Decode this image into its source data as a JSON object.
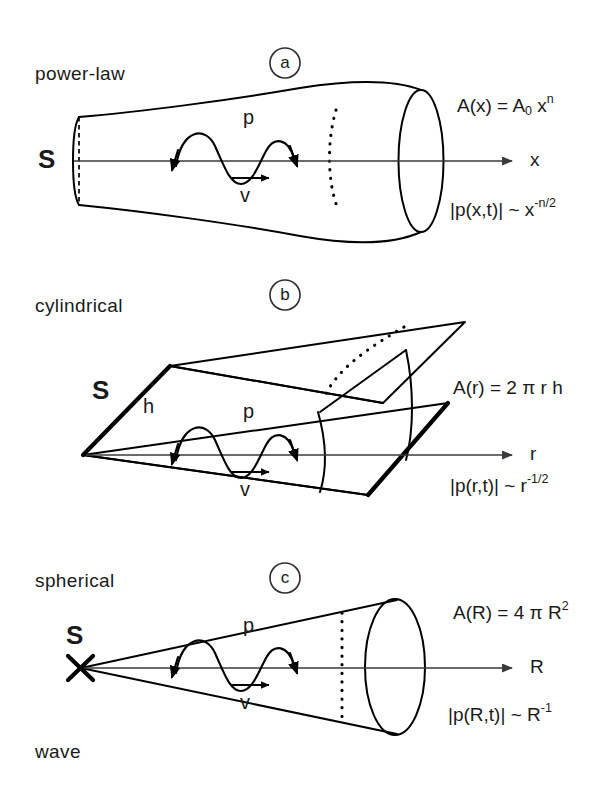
{
  "figure": {
    "background_color": "#ffffff",
    "ink_color": "#000000",
    "axis_color": "#3a3a3a"
  },
  "panels": [
    {
      "id": "a",
      "letter": "a",
      "category_label": "power-law",
      "source_label": "S",
      "axis_label": "x",
      "pressure_label": "p",
      "velocity_label": "v",
      "area_formula": {
        "lhs": "A(x) = A",
        "lhs_sub": "0",
        "mid": " x",
        "sup": "n"
      },
      "amplitude_formula": {
        "lhs": "|p(x,t)| ~ x",
        "sup": "-n/2"
      }
    },
    {
      "id": "b",
      "letter": "b",
      "category_label": "cylindrical",
      "source_label": "S",
      "height_label": "h",
      "axis_label": "r",
      "pressure_label": "p",
      "velocity_label": "v",
      "area_formula": {
        "lhs": "A(r) = 2 π r h",
        "sup": ""
      },
      "amplitude_formula": {
        "lhs": "|p(r,t)| ~ r",
        "sup": "-1/2"
      }
    },
    {
      "id": "c",
      "letter": "c",
      "category_label": "spherical",
      "category_label_second_line": "wave",
      "source_label": "S",
      "source_marker": "x-cross-marker",
      "axis_label": "R",
      "pressure_label": "p",
      "velocity_label": "v",
      "area_formula": {
        "lhs": "A(R) = 4 π R",
        "sup": "2"
      },
      "amplitude_formula": {
        "lhs": "|p(R,t)| ~ R",
        "sup": "-1"
      }
    }
  ]
}
